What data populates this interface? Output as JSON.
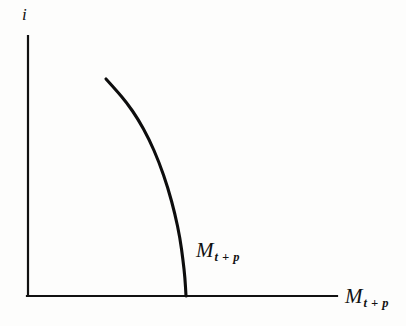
{
  "chart_data": {
    "type": "line",
    "title": "",
    "xlabel": "M t+p",
    "ylabel": "i",
    "grid": false,
    "legend": false,
    "axes": {
      "x_axis_label_text": "M",
      "x_axis_label_subscript": "t + p",
      "y_axis_label_text": "i",
      "x_range_px": [
        27,
        337
      ],
      "y_range_px": [
        36,
        296
      ],
      "origin_px": [
        27,
        296
      ],
      "ticks": [],
      "tick_labels": []
    },
    "series": [
      {
        "name": "M t+p",
        "annotation_text": "M",
        "annotation_subscript": "t + p",
        "description": "downward sloping money demand schedule, convex to the origin, steepening to vertical where it meets the horizontal axis",
        "points_px": [
          [
            106,
            79
          ],
          [
            116,
            90
          ],
          [
            127,
            103
          ],
          [
            138,
            119
          ],
          [
            149,
            139
          ],
          [
            159,
            162
          ],
          [
            168,
            188
          ],
          [
            175,
            214
          ],
          [
            180,
            238
          ],
          [
            183,
            260
          ],
          [
            185,
            278
          ],
          [
            186,
            296
          ]
        ]
      }
    ]
  },
  "figure": {
    "y_axis_label": "i",
    "x_axis_label_base": "M",
    "x_axis_label_sub": "t + p",
    "curve_label_base": "M",
    "curve_label_sub": "t + p"
  },
  "colors": {
    "ink": "#111111",
    "background": "#fdfdfc",
    "curve": "#0d0d0d"
  }
}
